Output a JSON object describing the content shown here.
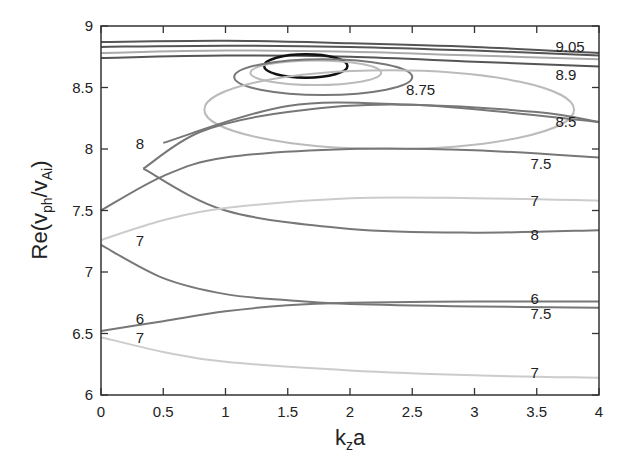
{
  "chart_data": {
    "type": "line",
    "title": "",
    "xlabel": "k_z a",
    "ylabel": "Re(v_ph/v_Ai)",
    "xlim": [
      0,
      4
    ],
    "ylim": [
      6,
      9
    ],
    "grid": false,
    "legend": "none (curves labeled inline)",
    "x_ticks": [
      "0",
      "0.5",
      "1",
      "1.5",
      "2",
      "2.5",
      "3",
      "3.5",
      "4"
    ],
    "y_ticks": [
      "6",
      "6.5",
      "7",
      "7.5",
      "8",
      "8.5",
      "9"
    ],
    "series": [
      {
        "name": "9.05",
        "color": "#555555",
        "x": [
          0,
          1,
          2,
          3,
          4
        ],
        "values": [
          8.87,
          8.88,
          8.86,
          8.83,
          8.78
        ]
      },
      {
        "name": "9.05 (lower branch)",
        "color": "#555555",
        "x": [
          0,
          1,
          2,
          3,
          4
        ],
        "values": [
          8.83,
          8.84,
          8.83,
          8.8,
          8.76
        ]
      },
      {
        "name": "8.9",
        "color": "#aaaaaa",
        "x": [
          0,
          1,
          2,
          3,
          4
        ],
        "values": [
          8.78,
          8.8,
          8.79,
          8.76,
          8.73
        ]
      },
      {
        "name": "8.9 (lower branch)",
        "color": "#555555",
        "x": [
          0,
          1,
          2,
          3,
          4
        ],
        "values": [
          8.74,
          8.76,
          8.75,
          8.71,
          8.67
        ]
      },
      {
        "name": "9.05 loop",
        "color": "#111111",
        "type": "closed",
        "x": [
          1.31,
          1.6,
          1.98,
          1.6,
          1.31
        ],
        "values": [
          8.68,
          8.77,
          8.67,
          8.58,
          8.68
        ]
      },
      {
        "name": "8.9 loop",
        "color": "#bbbbbb",
        "type": "closed",
        "x": [
          1.2,
          1.6,
          2.25,
          1.6,
          1.2
        ],
        "values": [
          8.64,
          8.72,
          8.62,
          8.52,
          8.64
        ]
      },
      {
        "name": "8.75",
        "color": "#777777",
        "type": "closed",
        "x": [
          1.07,
          1.6,
          2.5,
          1.6,
          1.07
        ],
        "values": [
          8.6,
          8.73,
          8.56,
          8.44,
          8.6
        ]
      },
      {
        "name": "8.5",
        "color": "#bbbbbb",
        "type": "closed",
        "x": [
          0.83,
          1.8,
          3.8,
          1.8,
          0.83
        ],
        "values": [
          8.35,
          8.64,
          8.3,
          8.0,
          8.35
        ]
      },
      {
        "name": "8.5 (open)",
        "color": "#777777",
        "x": [
          0.5,
          1.5,
          2.5,
          3.5,
          4
        ],
        "values": [
          8.05,
          8.35,
          8.36,
          8.3,
          8.22
        ]
      },
      {
        "name": "8 loop",
        "color": "#777777",
        "x": [
          0.34,
          1.0,
          2.0,
          3.0,
          4.0
        ],
        "values": [
          7.84,
          7.5,
          7.35,
          7.32,
          7.34
        ]
      },
      {
        "name": "8 loop (upper)",
        "color": "#777777",
        "x": [
          0.34,
          0.8,
          1.5,
          2.5,
          4.0
        ],
        "values": [
          7.84,
          8.14,
          8.3,
          8.36,
          8.22
        ]
      },
      {
        "name": "7.5",
        "color": "#777777",
        "x": [
          0,
          0.5,
          1,
          2,
          3,
          4
        ],
        "values": [
          7.5,
          7.78,
          7.93,
          8.0,
          7.99,
          7.93
        ]
      },
      {
        "name": "7 (upper)",
        "color": "#cccccc",
        "x": [
          0,
          0.5,
          1,
          2,
          3,
          4
        ],
        "values": [
          7.26,
          7.42,
          7.52,
          7.6,
          7.6,
          7.58
        ]
      },
      {
        "name": "7 (start)",
        "color": "#777777",
        "x": [
          0,
          0.5,
          1,
          1.5,
          2,
          3,
          4
        ],
        "values": [
          7.22,
          6.95,
          6.82,
          6.77,
          6.74,
          6.72,
          6.71
        ]
      },
      {
        "name": "6",
        "color": "#777777",
        "x": [
          0,
          0.5,
          1,
          1.5,
          2,
          3,
          4
        ],
        "values": [
          6.52,
          6.6,
          6.68,
          6.73,
          6.75,
          6.76,
          6.76
        ]
      },
      {
        "name": "7 (lower)",
        "color": "#cccccc",
        "x": [
          0,
          0.5,
          1,
          2,
          3,
          4
        ],
        "values": [
          6.47,
          6.35,
          6.27,
          6.2,
          6.16,
          6.14
        ]
      }
    ],
    "annotations": [
      {
        "text": "9.05",
        "x": 3.65,
        "y": 8.83
      },
      {
        "text": "8.9",
        "x": 3.65,
        "y": 8.6
      },
      {
        "text": "8.75",
        "x": 2.45,
        "y": 8.48
      },
      {
        "text": "8.5",
        "x": 3.65,
        "y": 8.22
      },
      {
        "text": "8",
        "x": 0.28,
        "y": 8.04
      },
      {
        "text": "7.5",
        "x": 3.45,
        "y": 7.88
      },
      {
        "text": "7",
        "x": 3.45,
        "y": 7.58
      },
      {
        "text": "8",
        "x": 3.45,
        "y": 7.3
      },
      {
        "text": "7",
        "x": 0.28,
        "y": 7.25
      },
      {
        "text": "6",
        "x": 3.45,
        "y": 6.78
      },
      {
        "text": "7.5",
        "x": 3.45,
        "y": 6.66
      },
      {
        "text": "6",
        "x": 0.28,
        "y": 6.62
      },
      {
        "text": "7",
        "x": 0.28,
        "y": 6.46
      },
      {
        "text": "7",
        "x": 3.45,
        "y": 6.18
      }
    ]
  }
}
